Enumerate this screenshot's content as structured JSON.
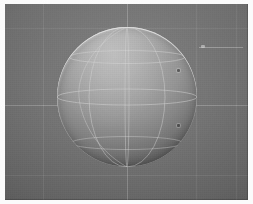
{
  "app": {
    "title": "3D Viewport",
    "scene_name": "Shaded UV Sphere on Grid Floor",
    "render_mode": "Solid Shading"
  },
  "viewport": {
    "background_color": "#767676",
    "grid_color": "#ffffff",
    "width": 243,
    "height": 196,
    "origin_label": "3D Cursor",
    "grid_visible": "on",
    "axis_lines_visible": "on"
  },
  "grid": {
    "vertical_lines": [
      {
        "name": "grid-v-1",
        "x": 38
      },
      {
        "name": "grid-v-2",
        "x": 122,
        "emphasis": "axis"
      },
      {
        "name": "grid-v-3",
        "x": 191
      },
      {
        "name": "grid-v-4",
        "x": 231
      }
    ],
    "horizontal_lines": [
      {
        "name": "grid-h-1",
        "y": 24
      },
      {
        "name": "grid-h-2",
        "y": 101,
        "emphasis": "axis"
      },
      {
        "name": "grid-h-3",
        "y": 171
      }
    ]
  },
  "sphere": {
    "label": "Sphere",
    "center_x": 122,
    "center_y": 94,
    "radius": 70,
    "highlight_color": "#b4b4b4",
    "shadow_color": "#343434",
    "rim_color": "#ffffff",
    "wire_color": "#d8d8d8",
    "light_direction": "upper-left",
    "segments": 32,
    "rings": 16
  },
  "markers": {
    "origin_dot_label": "origin-point",
    "pole_dot_label": "north-pole-point",
    "right_tick_label": "edge-highlight-segment"
  },
  "chart_data": {
    "type": "scatter",
    "xlabel": "",
    "ylabel": "",
    "categories": [
      "sphere"
    ],
    "values": [
      70
    ],
    "x": [
      122
    ],
    "y": [
      94
    ],
    "xlim": [
      0,
      243
    ],
    "ylim": [
      0,
      196
    ],
    "grid": true,
    "legend_position": "none",
    "annotations": [
      "origin dot at viewport center",
      "pole dot at sphere top",
      "short highlight segment at right edge"
    ]
  }
}
